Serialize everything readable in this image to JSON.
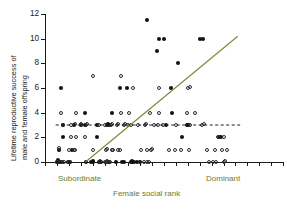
{
  "chart_data": {
    "type": "scatter",
    "title": "",
    "xlabel": "Female social rank",
    "ylabel_line1": "Lifetime reproductive success of",
    "ylabel_line2": "male and female offspring",
    "ylim": [
      0,
      12
    ],
    "yticks": [
      0,
      2,
      4,
      6,
      8,
      10,
      12
    ],
    "ytick_labels": [
      "0",
      "2",
      "4",
      "6",
      "8",
      "10",
      "12"
    ],
    "xlim": [
      0,
      20
    ],
    "xtick_count": 20,
    "xtick_labels": [],
    "grid": false,
    "x_category_low": "Subordinate",
    "x_category_high": "Dominant",
    "colors": {
      "male_marker": "#111111",
      "female_marker": "#2b2b2b",
      "male_fit_line": "#7d8c3a",
      "female_fit_line": "#1a1a1a",
      "axis": "#1a1a1a",
      "category_text": "#6b7a2e"
    },
    "series": [
      {
        "name": "male offspring",
        "marker": "filled-circle",
        "points": [
          [
            1.05,
            0.0
          ],
          [
            1.1,
            0.15
          ],
          [
            1.15,
            0.0
          ],
          [
            1.45,
            0.0
          ],
          [
            1.9,
            0.0
          ],
          [
            2.1,
            0.0
          ],
          [
            1.2,
            1.0
          ],
          [
            2.3,
            1.0
          ],
          [
            1.5,
            2.0
          ],
          [
            1.55,
            3.0
          ],
          [
            2.45,
            3.0
          ],
          [
            3.0,
            3.0
          ],
          [
            1.35,
            6.0
          ],
          [
            3.35,
            4.0
          ],
          [
            3.4,
            3.0
          ],
          [
            3.45,
            0.0
          ],
          [
            3.9,
            0.0
          ],
          [
            4.0,
            0.1
          ],
          [
            4.05,
            0.0
          ],
          [
            4.5,
            0.0
          ],
          [
            4.6,
            0.0
          ],
          [
            4.7,
            0.0
          ],
          [
            5.3,
            0.0
          ],
          [
            4.4,
            2.0
          ],
          [
            4.35,
            3.0
          ],
          [
            5.2,
            3.0
          ],
          [
            5.3,
            3.1
          ],
          [
            5.35,
            3.0
          ],
          [
            5.6,
            4.0
          ],
          [
            6.0,
            0.0
          ],
          [
            6.5,
            0.0
          ],
          [
            6.6,
            0.0
          ],
          [
            7.2,
            0.0
          ],
          [
            7.3,
            0.05
          ],
          [
            7.35,
            0.0
          ],
          [
            7.5,
            0.0
          ],
          [
            7.7,
            0.0
          ],
          [
            8.0,
            0.0
          ],
          [
            6.3,
            6.0
          ],
          [
            6.9,
            6.0
          ],
          [
            8.6,
            11.5
          ],
          [
            9.6,
            10.0
          ],
          [
            10.0,
            10.0
          ],
          [
            9.4,
            9.0
          ],
          [
            10.6,
            6.0
          ],
          [
            10.7,
            4.0
          ],
          [
            11.2,
            8.0
          ],
          [
            11.5,
            2.0
          ],
          [
            13.0,
            10.0
          ],
          [
            13.3,
            10.0
          ],
          [
            11.9,
            3.0
          ],
          [
            12.0,
            3.0
          ],
          [
            14.6,
            2.0
          ],
          [
            14.8,
            2.0
          ],
          [
            10.2,
            3.0
          ]
        ]
      },
      {
        "name": "female offspring",
        "marker": "open-circle",
        "points": [
          [
            1.0,
            0.0
          ],
          [
            1.25,
            0.0
          ],
          [
            1.6,
            0.0
          ],
          [
            2.0,
            0.0
          ],
          [
            1.15,
            1.0
          ],
          [
            1.2,
            1.1
          ],
          [
            2.0,
            1.0
          ],
          [
            2.4,
            1.0
          ],
          [
            2.55,
            1.0
          ],
          [
            1.55,
            3.0
          ],
          [
            2.2,
            3.0
          ],
          [
            2.45,
            3.0
          ],
          [
            2.55,
            3.05
          ],
          [
            3.0,
            3.0
          ],
          [
            3.05,
            3.1
          ],
          [
            1.35,
            4.0
          ],
          [
            2.6,
            4.0
          ],
          [
            2.2,
            2.0
          ],
          [
            2.6,
            2.0
          ],
          [
            3.35,
            2.0
          ],
          [
            3.45,
            3.0
          ],
          [
            3.5,
            3.1
          ],
          [
            4.05,
            1.0
          ],
          [
            4.6,
            0.0
          ],
          [
            4.65,
            0.05
          ],
          [
            5.0,
            0.0
          ],
          [
            5.1,
            0.0
          ],
          [
            5.2,
            0.05
          ],
          [
            5.4,
            0.0
          ],
          [
            5.5,
            0.0
          ],
          [
            5.15,
            1.0
          ],
          [
            5.25,
            1.05
          ],
          [
            5.6,
            1.0
          ],
          [
            5.75,
            1.0
          ],
          [
            6.1,
            1.0
          ],
          [
            6.3,
            1.0
          ],
          [
            4.5,
            3.0
          ],
          [
            5.0,
            3.0
          ],
          [
            5.55,
            3.0
          ],
          [
            5.6,
            3.05
          ],
          [
            6.05,
            3.0
          ],
          [
            6.1,
            3.05
          ],
          [
            6.6,
            3.0
          ],
          [
            6.7,
            3.1
          ],
          [
            7.0,
            3.0
          ],
          [
            7.2,
            3.0
          ],
          [
            6.4,
            4.0
          ],
          [
            7.1,
            4.0
          ],
          [
            8.0,
            0.0
          ],
          [
            8.3,
            0.0
          ],
          [
            8.6,
            0.0
          ],
          [
            8.7,
            0.0
          ],
          [
            8.1,
            1.0
          ],
          [
            8.6,
            1.0
          ],
          [
            8.9,
            1.0
          ],
          [
            9.0,
            1.05
          ],
          [
            7.8,
            3.0
          ],
          [
            8.4,
            3.0
          ],
          [
            8.5,
            3.05
          ],
          [
            9.2,
            3.0
          ],
          [
            9.5,
            3.0
          ],
          [
            9.9,
            3.0
          ],
          [
            8.8,
            4.0
          ],
          [
            9.6,
            4.0
          ],
          [
            10.4,
            1.0
          ],
          [
            10.9,
            1.0
          ],
          [
            11.4,
            1.0
          ],
          [
            12.1,
            1.0
          ],
          [
            11.0,
            3.0
          ],
          [
            12.2,
            3.0
          ],
          [
            13.2,
            3.0
          ],
          [
            13.4,
            3.05
          ],
          [
            11.9,
            4.0
          ],
          [
            12.6,
            4.0
          ],
          [
            13.8,
            0.0
          ],
          [
            14.1,
            0.0
          ],
          [
            14.4,
            0.0
          ],
          [
            15.0,
            0.0
          ],
          [
            15.1,
            0.05
          ],
          [
            13.6,
            1.0
          ],
          [
            14.3,
            1.0
          ],
          [
            14.9,
            1.0
          ],
          [
            15.3,
            1.0
          ],
          [
            14.5,
            2.0
          ],
          [
            15.0,
            2.05
          ],
          [
            7.4,
            6.0
          ],
          [
            9.6,
            6.0
          ],
          [
            12.0,
            6.0
          ],
          [
            12.2,
            6.05
          ],
          [
            4.0,
            7.0
          ],
          [
            6.4,
            7.0
          ]
        ]
      }
    ],
    "fit_lines": [
      {
        "name": "male regression line",
        "style": "solid",
        "color": "#7d8c3a",
        "x1": 3.4,
        "y1": 0.0,
        "x2": 16.2,
        "y2": 10.2
      },
      {
        "name": "female regression line",
        "style": "dashed",
        "color": "#1a1a1a",
        "x1": 0.9,
        "y1": 3.0,
        "x2": 16.4,
        "y2": 3.0
      }
    ]
  }
}
